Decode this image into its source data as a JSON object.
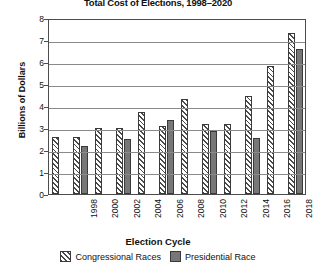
{
  "chart_data": {
    "type": "bar",
    "title": "Total Cost of Elections, 1998–2020",
    "xlabel": "Election Cycle",
    "ylabel": "Billions of Dollars",
    "ylim": [
      0,
      8
    ],
    "yticks": [
      0,
      1,
      2,
      3,
      4,
      5,
      6,
      7,
      8
    ],
    "ytick_labels": [
      "0",
      "1",
      "2",
      "3",
      "4",
      "5",
      "6",
      "7",
      "8"
    ],
    "grid": true,
    "legend_position": "bottom",
    "categories": [
      "1998",
      "2000",
      "2002",
      "2004",
      "2006",
      "2008",
      "2010",
      "2012",
      "2014",
      "2016",
      "2018",
      "2020"
    ],
    "series": [
      {
        "name": "Congressional Races",
        "color": "#4a4a4a",
        "fill": "hatched",
        "values": [
          2.6,
          2.6,
          3.0,
          3.0,
          3.75,
          3.1,
          4.3,
          3.2,
          3.2,
          4.45,
          5.8,
          7.3
        ]
      },
      {
        "name": "Presidential Race",
        "color": "#777777",
        "fill": "solid",
        "values": [
          null,
          2.2,
          null,
          2.5,
          null,
          3.35,
          null,
          2.85,
          null,
          2.55,
          null,
          6.6
        ]
      }
    ]
  },
  "legend": {
    "items": [
      {
        "label": "Congressional Races"
      },
      {
        "label": "Presidential Race"
      }
    ]
  }
}
